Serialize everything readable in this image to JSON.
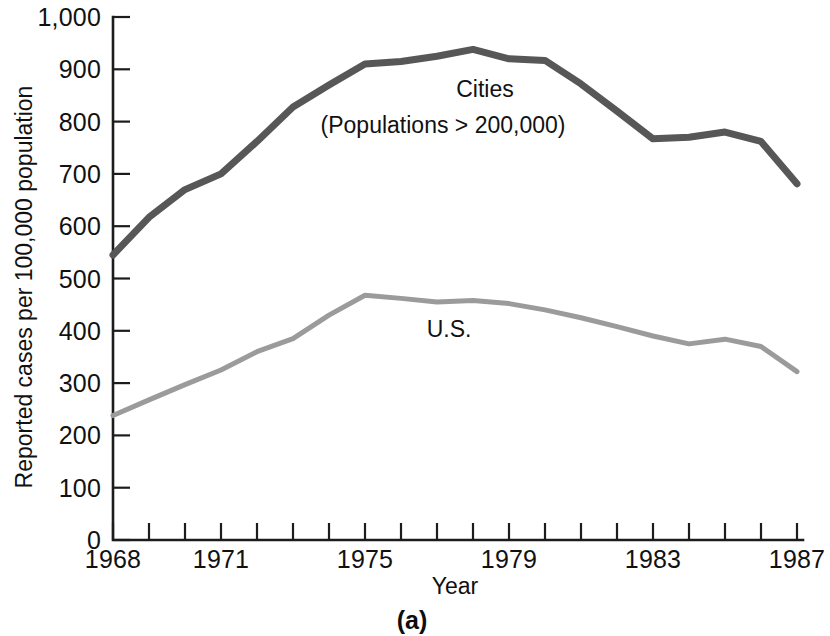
{
  "figure": {
    "caption": "(a)",
    "y_axis_title": "Reported cases per 100,000 population",
    "x_axis_title": "Year"
  },
  "labels": {
    "cities_line1": "Cities",
    "cities_line2": "(Populations  >  200,000)",
    "us": "U.S."
  },
  "chart_data": {
    "type": "line",
    "title": "",
    "xlabel": "Year",
    "ylabel": "Reported cases per 100,000 population",
    "xlim": [
      1968,
      1987
    ],
    "ylim": [
      0,
      1000
    ],
    "grid": false,
    "legend_position": "inline-annotation",
    "y_ticks": [
      0,
      100,
      200,
      300,
      400,
      500,
      600,
      700,
      800,
      900,
      1000
    ],
    "y_tick_labels": [
      "0",
      "100",
      "200",
      "300",
      "400",
      "500",
      "600",
      "700",
      "800",
      "900",
      "1,000"
    ],
    "x_ticks": [
      1968,
      1969,
      1970,
      1971,
      1972,
      1973,
      1974,
      1975,
      1976,
      1977,
      1978,
      1979,
      1980,
      1981,
      1982,
      1983,
      1984,
      1985,
      1986,
      1987
    ],
    "x_tick_labels_shown": [
      "1968",
      "1971",
      "1975",
      "1979",
      "1983",
      "1987"
    ],
    "x": [
      1968,
      1969,
      1970,
      1971,
      1972,
      1973,
      1974,
      1975,
      1976,
      1977,
      1978,
      1979,
      1980,
      1981,
      1982,
      1983,
      1984,
      1985,
      1986,
      1987
    ],
    "series": [
      {
        "name": "Cities (Populations > 200,000)",
        "color": "#575757",
        "stroke_width": 7,
        "values": [
          545,
          617,
          670,
          700,
          762,
          828,
          870,
          910,
          915,
          925,
          938,
          920,
          917,
          872,
          820,
          767,
          770,
          780,
          762,
          681
        ]
      },
      {
        "name": "U.S.",
        "color": "#9b9b9b",
        "stroke_width": 5,
        "values": [
          238,
          268,
          297,
          325,
          360,
          385,
          430,
          468,
          462,
          455,
          458,
          452,
          440,
          425,
          408,
          390,
          375,
          384,
          370,
          322
        ]
      }
    ]
  }
}
